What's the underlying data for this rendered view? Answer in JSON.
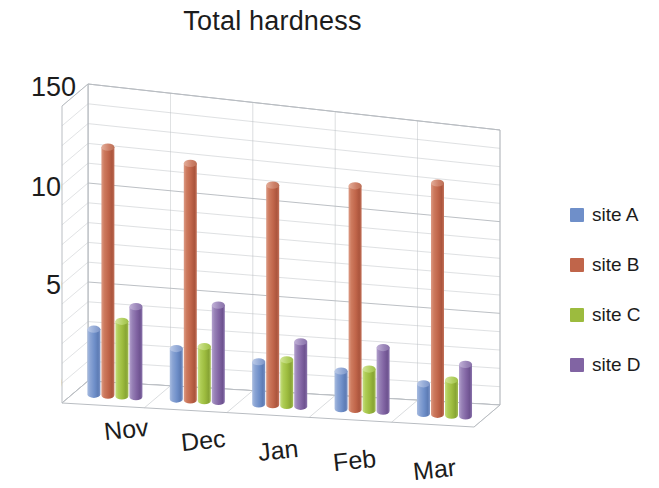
{
  "chart_data": {
    "type": "bar",
    "subtype": "3d-clustered-cylinder",
    "title": "Total hardness",
    "xlabel": "",
    "ylabel": "",
    "categories": [
      "Nov",
      "Dec",
      "Jan",
      "Feb",
      "Mar"
    ],
    "series": [
      {
        "name": "site A",
        "color": "#6f8fc9",
        "values": [
          33,
          26,
          22,
          20,
          16
        ]
      },
      {
        "name": "site B",
        "color": "#c0654a",
        "values": [
          126,
          122,
          115,
          119,
          125
        ]
      },
      {
        "name": "site C",
        "color": "#9cbb3e",
        "values": [
          38,
          28,
          24,
          22,
          19
        ]
      },
      {
        "name": "site D",
        "color": "#8164a3",
        "values": [
          46,
          50,
          34,
          34,
          28
        ]
      }
    ],
    "ylim": [
      0,
      150
    ],
    "yticks": [
      0,
      50,
      100,
      150
    ],
    "ytick_labels": [
      "0",
      "50",
      "100",
      "150"
    ],
    "minor_gridline_step": 10,
    "grid": true,
    "legend_position": "right",
    "legend_entries": [
      "site A",
      "site B",
      "site C",
      "site D"
    ]
  },
  "title": {
    "text": "Total hardness"
  },
  "yaxis": {
    "ticks": [
      {
        "label": "150",
        "value": 150
      },
      {
        "label": "100",
        "value": 100
      },
      {
        "label": "50",
        "value": 50
      },
      {
        "label": "0",
        "value": 0
      }
    ]
  },
  "xaxis": {
    "ticks": [
      {
        "label": "Nov"
      },
      {
        "label": "Dec"
      },
      {
        "label": "Jan"
      },
      {
        "label": "Feb"
      },
      {
        "label": "Mar"
      }
    ]
  },
  "legend": {
    "items": [
      {
        "label": "site A",
        "color": "#6f8fc9"
      },
      {
        "label": "site B",
        "color": "#c0654a"
      },
      {
        "label": "site C",
        "color": "#9cbb3e"
      },
      {
        "label": "site D",
        "color": "#8164a3"
      }
    ]
  }
}
